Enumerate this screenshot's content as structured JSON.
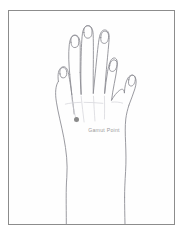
{
  "figure": {
    "top_caption": "",
    "frame_color": "#8c8c8c",
    "background_color": "#fefefe",
    "outline_color": "#8d8d94"
  },
  "diagram": {
    "marker": {
      "label": "Gamut Point",
      "dot_color": "#8a8a8a",
      "label_color": "#9a9a9a"
    }
  }
}
